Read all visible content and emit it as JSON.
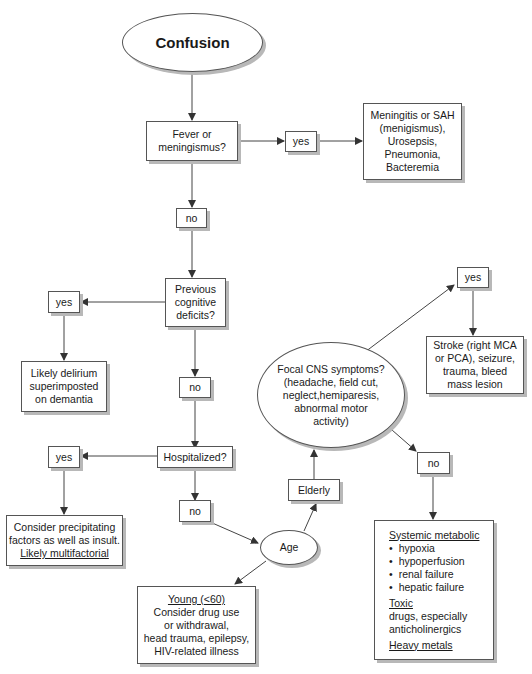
{
  "title": "Confusion",
  "nodes": {
    "fever": "Fever or meningismus?",
    "fever_yes": "yes",
    "meningitis": [
      "Meningitis or SAH",
      "(menigismus),",
      "Urosepsis,",
      "Pneumonia,",
      "Bacteremia"
    ],
    "fever_no": "no",
    "previous": [
      "Previous",
      "cognitive",
      "deficits?"
    ],
    "previous_yes": "yes",
    "delirium": [
      "Likely delirium",
      "superimposted",
      "on demantia"
    ],
    "previous_no": "no",
    "hospitalized": "Hospitalized?",
    "hosp_yes": "yes",
    "precipitating": [
      "Consider precipitating",
      "factors as well as insult."
    ],
    "precipitating_underlined": "Likely multifactorial",
    "hosp_no": "no",
    "age": "Age",
    "elderly": "Elderly",
    "young_title": "Young (<60)",
    "young_lines": [
      "Consider drug use",
      "or withdrawal,",
      "head trauma, epilepsy,",
      "HIV-related illness"
    ],
    "focal": [
      "Focal CNS symptoms?",
      "(headache, field cut,",
      "neglect,hemiparesis,",
      "abnormal motor",
      "activity)"
    ],
    "focal_yes": "yes",
    "stroke": [
      "Stroke (right MCA",
      "or PCA), seizure,",
      "trauma, bleed",
      "mass lesion"
    ],
    "focal_no": "no",
    "systemic_title": "Systemic metabolic",
    "systemic_items": [
      "hypoxia",
      "hypoperfusion",
      "renal failure",
      "hepatic failure"
    ],
    "toxic_title": "Toxic",
    "toxic_lines": [
      "drugs, especially",
      "anticholinergics"
    ],
    "heavy_metals": "Heavy metals"
  },
  "colors": {
    "line": "#444444",
    "border": "#555555",
    "shadow": "#b8b8b8"
  }
}
